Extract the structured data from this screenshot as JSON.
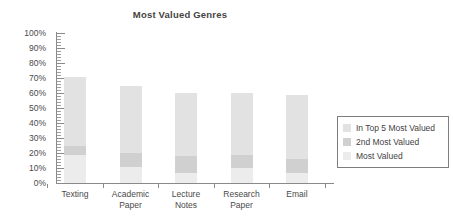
{
  "chart_data": {
    "type": "bar",
    "subtype": "stacked-column",
    "title": "Most Valued Genres",
    "xlabel": "",
    "ylabel": "",
    "ylim": [
      0,
      100
    ],
    "y_unit": "%",
    "grid": false,
    "legend_position": "right",
    "y_ticks": [
      "100%",
      "90%",
      "80%",
      "70%",
      "60%",
      "50%",
      "40%",
      "30%",
      "20%",
      "10%",
      "0%"
    ],
    "y_tick_values": [
      100,
      90,
      80,
      70,
      60,
      50,
      40,
      30,
      20,
      10,
      0
    ],
    "y_minor_tick_step": 2,
    "categories": [
      "Texting",
      "Academic Paper",
      "Lecture Notes",
      "Research Paper",
      "Email"
    ],
    "category_lines": [
      [
        "Texting"
      ],
      [
        "Academic",
        "Paper"
      ],
      [
        "Lecture",
        "Notes"
      ],
      [
        "Research",
        "Paper"
      ],
      [
        "Email"
      ]
    ],
    "series": [
      {
        "name": "Most Valued",
        "color": "#ececec",
        "values": [
          19,
          11,
          7,
          10,
          7
        ]
      },
      {
        "name": "2nd Most Valued",
        "color": "#d0d0d0",
        "values": [
          6,
          9,
          11,
          9,
          9
        ]
      },
      {
        "name": "In Top 5 Most Valued",
        "color": "#e2e2e2",
        "values": [
          46,
          45,
          42,
          41,
          43
        ]
      }
    ],
    "totals": [
      71,
      65,
      60,
      60,
      59
    ]
  },
  "legend": {
    "items": [
      {
        "label": "In Top 5 Most Valued",
        "color": "#e2e2e2"
      },
      {
        "label": "2nd Most Valued",
        "color": "#d0d0d0"
      },
      {
        "label": "Most Valued",
        "color": "#ececec"
      }
    ]
  },
  "colors": {
    "axis": "#8a8a8a",
    "text": "#4a4a4a",
    "title": "#444444",
    "background": "#ffffff",
    "legend_border": "#7d7d7d"
  }
}
